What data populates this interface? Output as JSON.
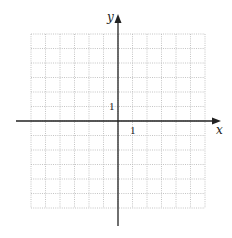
{
  "diagram": {
    "type": "coordinate-grid",
    "x_axis_label": "x",
    "y_axis_label": "y",
    "x_unit_label": "1",
    "y_unit_label": "1",
    "grid": {
      "columns": 12,
      "rows": 12,
      "style": "dotted"
    },
    "colors": {
      "axis": "#222222",
      "grid": "#b5b5b5"
    }
  }
}
